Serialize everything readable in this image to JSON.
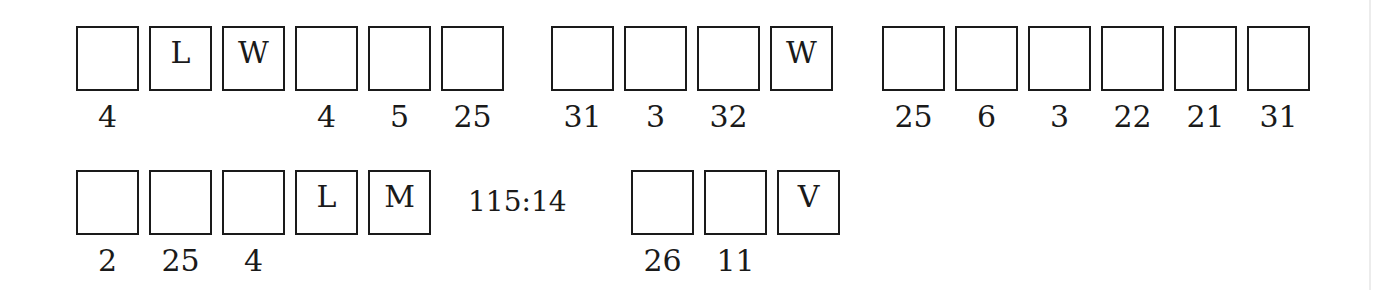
{
  "puzzle": {
    "rows": [
      {
        "words": [
          {
            "cells": [
              {
                "letter": "",
                "number": "4"
              },
              {
                "letter": "L",
                "number": ""
              },
              {
                "letter": "W",
                "number": ""
              },
              {
                "letter": "",
                "number": "4"
              },
              {
                "letter": "",
                "number": "5"
              },
              {
                "letter": "",
                "number": "25"
              }
            ]
          },
          {
            "cells": [
              {
                "letter": "",
                "number": "31"
              },
              {
                "letter": "",
                "number": "3"
              },
              {
                "letter": "",
                "number": "32"
              },
              {
                "letter": "W",
                "number": ""
              }
            ]
          },
          {
            "cells": [
              {
                "letter": "",
                "number": "25"
              },
              {
                "letter": "",
                "number": "6"
              },
              {
                "letter": "",
                "number": "3"
              },
              {
                "letter": "",
                "number": "22"
              },
              {
                "letter": "",
                "number": "21"
              },
              {
                "letter": "",
                "number": "31"
              }
            ]
          }
        ]
      },
      {
        "words": [
          {
            "cells": [
              {
                "letter": "",
                "number": "2"
              },
              {
                "letter": "",
                "number": "25"
              },
              {
                "letter": "",
                "number": "4"
              },
              {
                "letter": "L",
                "number": ""
              },
              {
                "letter": "M",
                "number": ""
              }
            ]
          },
          {
            "cells": [
              {
                "letter": "",
                "number": "26"
              },
              {
                "letter": "",
                "number": "11"
              },
              {
                "letter": "V",
                "number": ""
              }
            ]
          }
        ]
      }
    ],
    "reference": "115:14"
  }
}
